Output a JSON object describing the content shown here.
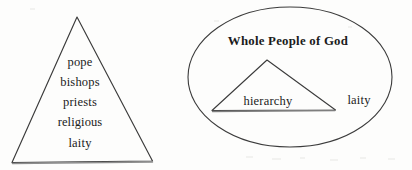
{
  "page": {
    "background_color": "#fdfdfc",
    "ink_color": "#2a2a2a",
    "text_color": "#1b1b1b"
  },
  "pyramid_figure": {
    "name": "hierarchical-pyramid",
    "shape": "triangle",
    "apex": {
      "x": 77,
      "y": 17
    },
    "base_left": {
      "x": 12,
      "y": 162
    },
    "base_right": {
      "x": 152,
      "y": 162
    },
    "labels": [
      {
        "text": "pope",
        "x": 80,
        "y": 62
      },
      {
        "text": "bishops",
        "x": 80,
        "y": 82
      },
      {
        "text": "priests",
        "x": 80,
        "y": 102
      },
      {
        "text": "religious",
        "x": 80,
        "y": 122
      },
      {
        "text": "laity",
        "x": 80,
        "y": 143
      }
    ]
  },
  "ellipse_figure": {
    "name": "whole-people-of-god",
    "shape": "ellipse",
    "center": {
      "x": 290,
      "y": 77
    },
    "radius_x": 102,
    "radius_y": 70,
    "title": "Whole People of God",
    "title_position": {
      "x": 288,
      "y": 42
    },
    "inner_triangle": {
      "apex": {
        "x": 267,
        "y": 60
      },
      "base_left": {
        "x": 212,
        "y": 110
      },
      "base_right": {
        "x": 335,
        "y": 110
      }
    },
    "labels": [
      {
        "text": "hierarchy",
        "x": 268,
        "y": 101,
        "inside_triangle": true
      },
      {
        "text": "laity",
        "x": 359,
        "y": 100,
        "inside_triangle": false
      }
    ]
  }
}
